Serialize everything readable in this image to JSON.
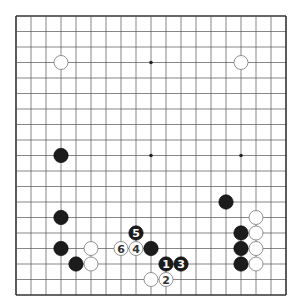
{
  "board": {
    "size": 19,
    "origin_x": 16,
    "origin_y": 16,
    "step_x": 15,
    "step_y": 15.5,
    "line_color": "#555555",
    "border_color": "#333333",
    "background": "#ffffff",
    "star_points": [
      [
        9,
        3
      ],
      [
        9,
        9
      ],
      [
        15,
        9
      ]
    ]
  },
  "stones": [
    {
      "color": "white",
      "col": 3,
      "row": 3,
      "label": ""
    },
    {
      "color": "white",
      "col": 15,
      "row": 3,
      "label": ""
    },
    {
      "color": "black",
      "col": 3,
      "row": 9,
      "label": ""
    },
    {
      "color": "black",
      "col": 14,
      "row": 12,
      "label": ""
    },
    {
      "color": "black",
      "col": 3,
      "row": 13,
      "label": ""
    },
    {
      "color": "white",
      "col": 16,
      "row": 13,
      "label": ""
    },
    {
      "color": "black",
      "col": 8,
      "row": 14,
      "label": "5"
    },
    {
      "color": "black",
      "col": 15,
      "row": 14,
      "label": ""
    },
    {
      "color": "white",
      "col": 16,
      "row": 14,
      "label": ""
    },
    {
      "color": "black",
      "col": 3,
      "row": 15,
      "label": ""
    },
    {
      "color": "white",
      "col": 5,
      "row": 15,
      "label": ""
    },
    {
      "color": "white",
      "col": 7,
      "row": 15,
      "label": "6"
    },
    {
      "color": "white",
      "col": 8,
      "row": 15,
      "label": "4"
    },
    {
      "color": "black",
      "col": 9,
      "row": 15,
      "label": ""
    },
    {
      "color": "black",
      "col": 15,
      "row": 15,
      "label": ""
    },
    {
      "color": "white",
      "col": 16,
      "row": 15,
      "label": ""
    },
    {
      "color": "black",
      "col": 4,
      "row": 16,
      "label": ""
    },
    {
      "color": "white",
      "col": 5,
      "row": 16,
      "label": ""
    },
    {
      "color": "black",
      "col": 10,
      "row": 16,
      "label": "1"
    },
    {
      "color": "black",
      "col": 11,
      "row": 16,
      "label": "3"
    },
    {
      "color": "black",
      "col": 15,
      "row": 16,
      "label": ""
    },
    {
      "color": "white",
      "col": 16,
      "row": 16,
      "label": ""
    },
    {
      "color": "white",
      "col": 9,
      "row": 17,
      "label": ""
    },
    {
      "color": "white",
      "col": 10,
      "row": 17,
      "label": "2"
    }
  ]
}
